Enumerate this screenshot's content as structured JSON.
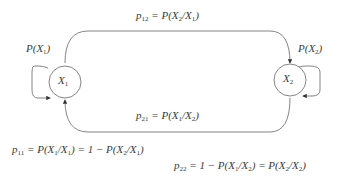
{
  "diagram": {
    "type": "markov-chain-two-state",
    "nodes": [
      {
        "id": "X1",
        "label": "X1",
        "cx": 37,
        "cy": 80,
        "r": 15
      },
      {
        "id": "X2",
        "label": "X2",
        "cx": 307,
        "cy": 80,
        "r": 15
      }
    ],
    "edges": [
      {
        "from": "X1",
        "to": "X2",
        "label": "p12 = P(X2/X1)",
        "route": "top"
      },
      {
        "from": "X2",
        "to": "X1",
        "label": "p21 = P(X1/X2)",
        "route": "bottom"
      },
      {
        "from": "X1",
        "to": "X1",
        "label": "p11 = P(X1/X1) = 1 − P(X2/X1)",
        "route": "self-loop-left"
      },
      {
        "from": "X2",
        "to": "X2",
        "label": "p22 = 1 − P(X1/X2) = P(X2/X2)",
        "route": "self-loop-right"
      }
    ],
    "state_probabilities": [
      {
        "node": "X1",
        "label": "P(X1)"
      },
      {
        "node": "X2",
        "label": "P(X2)"
      }
    ],
    "colors": {
      "stroke": "#555555",
      "text": "#3a3a3a",
      "background": "#ffffff"
    }
  }
}
